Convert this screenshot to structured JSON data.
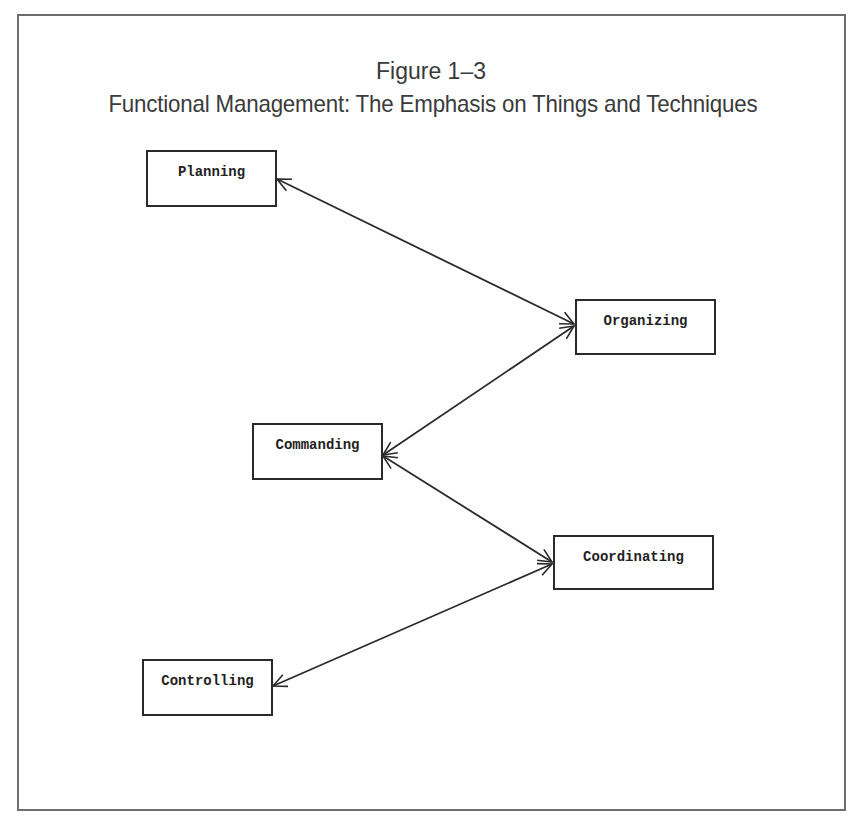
{
  "figure": {
    "number": "Figure 1–3",
    "title": "Functional Management: The Emphasis on Things and Techniques"
  },
  "nodes": [
    {
      "id": "planning",
      "label": "Planning",
      "x": 146,
      "y": 150,
      "w": 131,
      "h": 57
    },
    {
      "id": "organizing",
      "label": "Organizing",
      "x": 575,
      "y": 299,
      "w": 141,
      "h": 56
    },
    {
      "id": "commanding",
      "label": "Commanding",
      "x": 252,
      "y": 423,
      "w": 131,
      "h": 57
    },
    {
      "id": "coordinating",
      "label": "Coordinating",
      "x": 553,
      "y": 535,
      "w": 161,
      "h": 55
    },
    {
      "id": "controlling",
      "label": "Controlling",
      "x": 142,
      "y": 659,
      "w": 131,
      "h": 57
    }
  ],
  "edges": [
    {
      "from": "planning",
      "to": "organizing",
      "bidirectional": true
    },
    {
      "from": "organizing",
      "to": "commanding",
      "bidirectional": true
    },
    {
      "from": "commanding",
      "to": "coordinating",
      "bidirectional": true
    },
    {
      "from": "coordinating",
      "to": "controlling",
      "bidirectional": true
    }
  ],
  "colors": {
    "line": "#2a2a2a",
    "border": "#6e6e6e",
    "text": "#3a3a3a"
  }
}
